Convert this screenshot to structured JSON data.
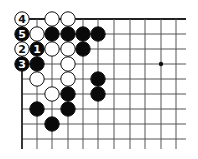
{
  "diagram": {
    "type": "go-board-corner",
    "grid": {
      "x_lines": [
        22,
        37,
        52,
        68,
        83,
        98,
        114,
        130,
        145,
        161,
        176
      ],
      "y_lines": [
        19,
        34,
        49,
        64,
        79,
        94,
        109,
        124,
        139
      ],
      "right_end": 186,
      "bottom_end": 149,
      "top_edge": true,
      "left_edge": true,
      "line_color": "#555555",
      "edge_color": "#222222"
    },
    "hoshi": [
      {
        "col": 9,
        "row": 3
      }
    ],
    "stones": [
      {
        "col": 0,
        "row": 0,
        "color": "white",
        "label": "4"
      },
      {
        "col": 2,
        "row": 0,
        "color": "white",
        "label": ""
      },
      {
        "col": 3,
        "row": 0,
        "color": "white",
        "label": ""
      },
      {
        "col": 0,
        "row": 1,
        "color": "black",
        "label": "5"
      },
      {
        "col": 1,
        "row": 1,
        "color": "white",
        "label": ""
      },
      {
        "col": 2,
        "row": 1,
        "color": "black",
        "label": ""
      },
      {
        "col": 3,
        "row": 1,
        "color": "black",
        "label": ""
      },
      {
        "col": 4,
        "row": 1,
        "color": "black",
        "label": ""
      },
      {
        "col": 5,
        "row": 1,
        "color": "black",
        "label": ""
      },
      {
        "col": 0,
        "row": 2,
        "color": "white",
        "label": "2"
      },
      {
        "col": 1,
        "row": 2,
        "color": "black",
        "label": "1"
      },
      {
        "col": 2,
        "row": 2,
        "color": "white",
        "label": ""
      },
      {
        "col": 3,
        "row": 2,
        "color": "white",
        "label": ""
      },
      {
        "col": 4,
        "row": 2,
        "color": "black",
        "label": ""
      },
      {
        "col": 0,
        "row": 3,
        "color": "black",
        "label": "3"
      },
      {
        "col": 1,
        "row": 3,
        "color": "black",
        "label": ""
      },
      {
        "col": 3,
        "row": 3,
        "color": "white",
        "label": ""
      },
      {
        "col": 1,
        "row": 4,
        "color": "white",
        "label": ""
      },
      {
        "col": 3,
        "row": 4,
        "color": "white",
        "label": ""
      },
      {
        "col": 5,
        "row": 4,
        "color": "black",
        "label": ""
      },
      {
        "col": 2,
        "row": 5,
        "color": "white",
        "label": ""
      },
      {
        "col": 3,
        "row": 5,
        "color": "black",
        "label": ""
      },
      {
        "col": 5,
        "row": 5,
        "color": "black",
        "label": ""
      },
      {
        "col": 1,
        "row": 6,
        "color": "black",
        "label": ""
      },
      {
        "col": 3,
        "row": 6,
        "color": "black",
        "label": ""
      },
      {
        "col": 2,
        "row": 7,
        "color": "black",
        "label": ""
      }
    ]
  }
}
